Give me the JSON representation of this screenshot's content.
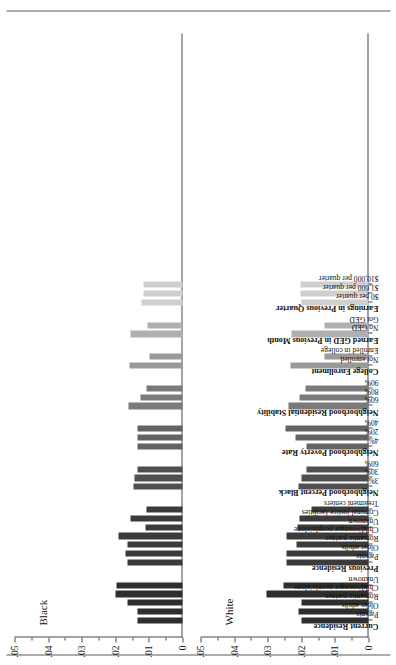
{
  "chart_data": {
    "type": "bar",
    "title": "",
    "xlabel": "",
    "ylabel": "",
    "ylim": [
      0,
      0.05
    ],
    "ytick_labels": [
      "0",
      ".01",
      ".02",
      ".03",
      ".04",
      ".05"
    ],
    "ytick_values": [
      0,
      0.01,
      0.02,
      0.03,
      0.04,
      0.05
    ],
    "yminor_values": [
      0.005,
      0.015,
      0.025,
      0.035,
      0.045
    ],
    "grid": false,
    "legend_position": "none",
    "panels": [
      {
        "title": "Black",
        "name": "black"
      },
      {
        "title": "White",
        "name": "white"
      }
    ],
    "groups": [
      {
        "heading": "Current Residence",
        "color": "#2f2f2f",
        "categories": [
          "Parents",
          "Older adults",
          "Romantic partner",
          "Child/younger people/alone",
          "Unknown"
        ],
        "series": [
          {
            "name": "Black",
            "values": [
              0.0135,
              0.0135,
              0.0165,
              0.02,
              0.0196
            ]
          },
          {
            "name": "White",
            "values": [
              0.02,
              0.0208,
              0.02,
              0.0305,
              0.0253
            ]
          }
        ]
      },
      {
        "heading": "Previous Residence",
        "color": "#3b3b3b",
        "categories": [
          "Parents",
          "Older adults",
          "Romantic partner",
          "Child/younger people/alone",
          "Unknown",
          "Criminal justice facilities",
          "Treatment centers"
        ],
        "series": [
          {
            "name": "Black",
            "values": [
              0.0165,
              0.017,
              0.0163,
              0.019,
              0.011,
              0.0155,
              0.0108
            ]
          },
          {
            "name": "White",
            "values": [
              0.0243,
              0.0245,
              0.0215,
              0.0243,
              0.0212,
              0.0205,
              0.017
            ]
          }
        ]
      },
      {
        "heading": "Neighborhood Percent Black",
        "color": "#4f4f4f",
        "categories": [
          "3%",
          "30%",
          "60%"
        ],
        "series": [
          {
            "name": "Black",
            "values": [
              0.0147,
              0.0142,
              0.0135
            ]
          },
          {
            "name": "White",
            "values": [
              0.0208,
              0.02,
              0.0185
            ]
          }
        ]
      },
      {
        "heading": "Neighborhood Poverty Rate",
        "color": "#636363",
        "categories": [
          "4%",
          "20%",
          "40%"
        ],
        "series": [
          {
            "name": "Black",
            "values": [
              0.0133,
              0.0133,
              0.0135
            ]
          },
          {
            "name": "White",
            "values": [
              0.0185,
              0.0218,
              0.0247
            ]
          }
        ]
      },
      {
        "heading": "Neighborhood Residential Stability",
        "color": "#7a7a7a",
        "categories": [
          "60%",
          "80%",
          "90%"
        ],
        "series": [
          {
            "name": "Black",
            "values": [
              0.016,
              0.0125,
              0.0108
            ]
          },
          {
            "name": "White",
            "values": [
              0.0238,
              0.0205,
              0.0188
            ]
          }
        ]
      },
      {
        "heading": "College Enrollment",
        "color": "#9a9a9a",
        "categories": [
          "Not enrolled",
          "Enrolled in college"
        ],
        "series": [
          {
            "name": "Black",
            "values": [
              0.0158,
              0.0098
            ]
          },
          {
            "name": "White",
            "values": [
              0.0232,
              0.0132
            ]
          }
        ]
      },
      {
        "heading": "Earned GED in Previous Month",
        "color": "#b0b0b0",
        "categories": [
          "No GED",
          "Got GED"
        ],
        "series": [
          {
            "name": "Black",
            "values": [
              0.0155,
              0.0105
            ]
          },
          {
            "name": "White",
            "values": [
              0.023,
              0.0132
            ]
          }
        ]
      },
      {
        "heading": "Earnings in Previous Quarter",
        "color": "#cfcfcf",
        "categories": [
          "$0 per quarter",
          "$1,000 per quarter",
          "$10,000 per quarter"
        ],
        "series": [
          {
            "name": "Black",
            "values": [
              0.0122,
              0.0117,
              0.0115
            ]
          },
          {
            "name": "White",
            "values": [
              0.02,
              0.0202,
              0.0203
            ]
          }
        ]
      }
    ]
  }
}
